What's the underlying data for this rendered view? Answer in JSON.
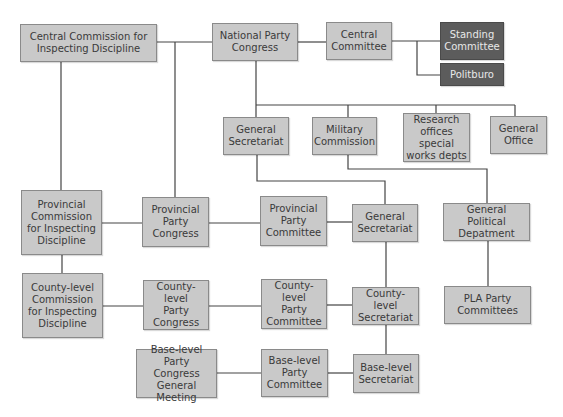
{
  "diagram": {
    "title": "",
    "nodes": {
      "central_commission": "Central Commission for\nInspecting Discipline",
      "national_party_congress": "National Party\nCongress",
      "central_committee": "Central\nCommittee",
      "standing_committee": "Standing\nCommittee",
      "politburo": "Politburo",
      "general_secretariat_top": "General\nSecretariat",
      "military_commission": "Military\nCommission",
      "research_offices": "Research\noffices special\nworks depts",
      "general_office": "General\nOffice",
      "provincial_commission": "Provincial\nCommission\nfor Inspecting\nDiscipline",
      "provincial_party_congress": "Provincial\nParty\nCongress",
      "provincial_party_committee": "Provincial\nParty\nCommittee",
      "general_secretariat_mid": "General\nSecretariat",
      "general_political_department": "General Political\nDepatment",
      "county_commission": "County-level\nCommission\nfor Inspecting\nDiscipline",
      "county_party_congress": "County-level\nParty\nCongress",
      "county_party_committee": "County-level\nParty\nCommittee",
      "county_secretariat": "County-level\nSecretariat",
      "pla_party_committees": "PLA Party\nCommittees",
      "base_party_congress": "Base-level\nParty Congress\nGeneral Meeting",
      "base_party_committee": "Base-level\nParty\nCommittee",
      "base_secretariat": "Base-level\nSecretariat"
    },
    "colors": {
      "box_fill": "#c9c9c9",
      "box_dark_fill": "#5c5c5c",
      "line": "#444444"
    }
  }
}
